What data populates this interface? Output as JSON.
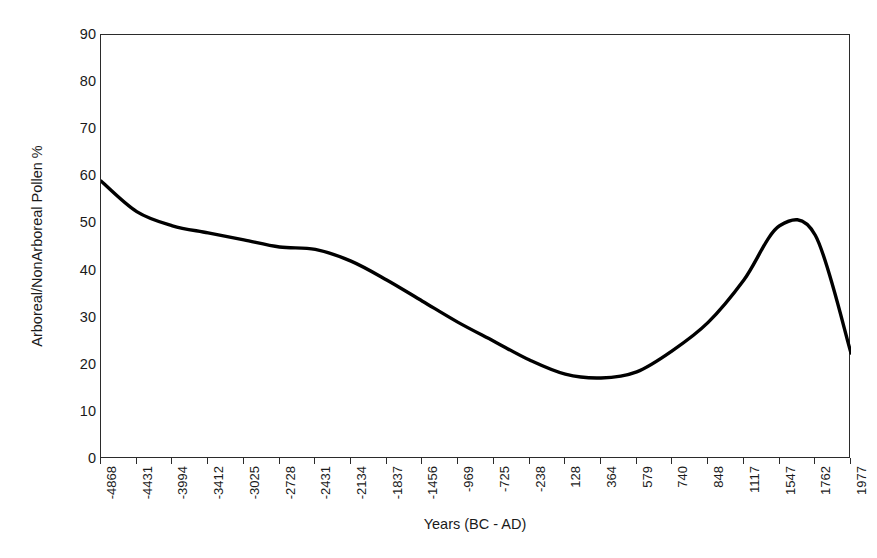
{
  "chart_data": {
    "type": "line",
    "title": "",
    "xlabel": "Years (BC - AD)",
    "ylabel": "Arboreal/NonArboreal Pollen %",
    "ylim": [
      0,
      90
    ],
    "yticks": [
      0,
      10,
      20,
      30,
      40,
      50,
      60,
      70,
      80,
      90
    ],
    "grid": false,
    "legend": "none",
    "line_color": "#000000",
    "line_width": 3.4,
    "categories": [
      "-4868",
      "-4431",
      "-3994",
      "-3412",
      "-3025",
      "-2728",
      "-2431",
      "-2134",
      "-1837",
      "-1456",
      "-969",
      "-725",
      "-238",
      "128",
      "364",
      "579",
      "740",
      "848",
      "1117",
      "1547",
      "1762",
      "1977"
    ],
    "series": [
      {
        "name": "Arboreal/NonArboreal Pollen %",
        "values": [
          59.0,
          52.5,
          49.5,
          48.0,
          46.5,
          45.0,
          44.5,
          42.0,
          38.0,
          33.5,
          29.0,
          25.0,
          21.0,
          18.0,
          17.2,
          18.5,
          23.0,
          29.0,
          38.0,
          49.5,
          47.5,
          22.5
        ]
      }
    ]
  },
  "axes": {
    "y_title": "Arboreal/NonArboreal Pollen %",
    "x_title": "Years (BC - AD)",
    "y_tick_labels": [
      "90",
      "80",
      "70",
      "60",
      "50",
      "40",
      "30",
      "20",
      "10",
      "0"
    ],
    "x_tick_labels": [
      "-4868",
      "-4431",
      "-3994",
      "-3412",
      "-3025",
      "-2728",
      "-2431",
      "-2134",
      "-1837",
      "-1456",
      "-969",
      "-725",
      "-238",
      "128",
      "364",
      "579",
      "740",
      "848",
      "1117",
      "1547",
      "1762",
      "1977"
    ]
  }
}
